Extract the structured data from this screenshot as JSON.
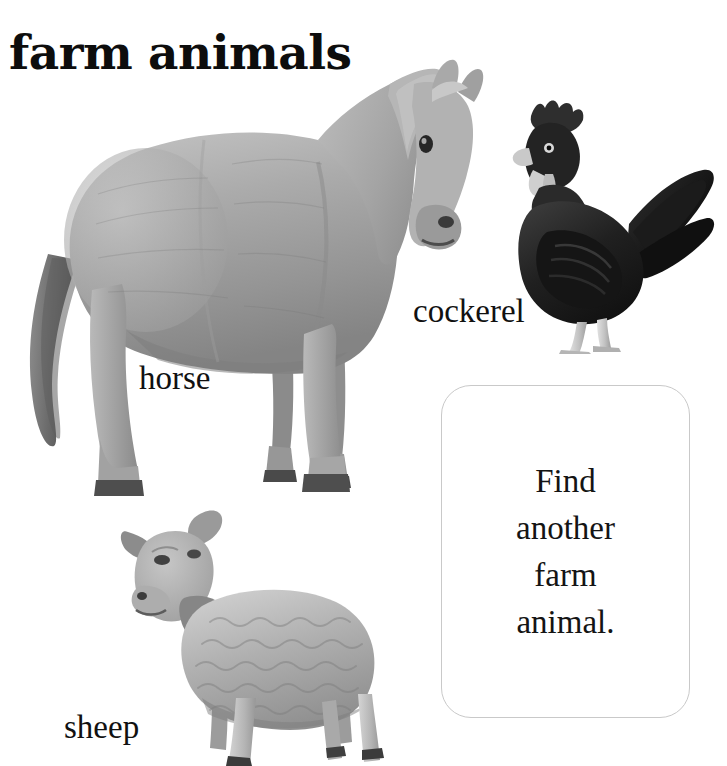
{
  "page": {
    "title": "farm animals",
    "background_color": "#ffffff",
    "text_color": "#111111",
    "card_border_color": "#c9c9c9",
    "width": 727,
    "height": 766
  },
  "animals": [
    {
      "id": "horse",
      "label": "horse",
      "icon_name": "horse-photo",
      "description": "grayscale photograph of a light grey horse standing, facing right",
      "tone": "#a8a8a8"
    },
    {
      "id": "cockerel",
      "label": "cockerel",
      "icon_name": "cockerel-photo",
      "description": "grayscale photograph of a dark rooster standing, facing left",
      "tone": "#2a2a2a"
    },
    {
      "id": "sheep",
      "label": "sheep",
      "icon_name": "sheep-photo",
      "description": "grayscale photograph of a woolly sheep standing, facing left",
      "tone": "#9a9a9a"
    }
  ],
  "instruction_card": {
    "name": "find-another-farm-animal-card",
    "lines": [
      "Find",
      "another",
      "farm",
      "animal."
    ],
    "full_text": "Find another farm animal."
  }
}
